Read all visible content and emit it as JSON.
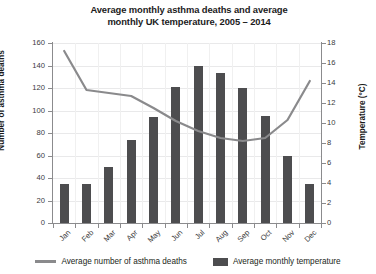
{
  "chart_data": {
    "type": "bar",
    "title": "Average monthly asthma deaths and average monthly UK temperature, 2005 – 2014",
    "title_line1": "Average monthly asthma deaths and average",
    "title_line2": "monthly UK temperature, 2005 – 2014",
    "categories": [
      "Jan",
      "Feb",
      "Mar",
      "Apr",
      "May",
      "Jun",
      "Jul",
      "Aug",
      "Sep",
      "Oct",
      "Nov",
      "Dec"
    ],
    "xlabel": "",
    "grid": true,
    "legend_position": "bottom",
    "series": [
      {
        "name": "Average number of asthma deaths",
        "type": "line",
        "axis": "right",
        "color": "#8a8a8c",
        "values": [
          17.2,
          13.3,
          13.0,
          12.7,
          11.5,
          10.2,
          9.2,
          8.5,
          8.2,
          8.5,
          10.3,
          14.2
        ]
      },
      {
        "name": "Average monthly temperature",
        "type": "bar",
        "axis": "left",
        "color": "#4d4d4f",
        "values": [
          35,
          35,
          50,
          74,
          94,
          121,
          140,
          133,
          120,
          95,
          60,
          35
        ]
      }
    ],
    "left_axis": {
      "label": "Number of asthma deaths",
      "ylim": [
        0,
        160
      ],
      "ticks": [
        0,
        20,
        40,
        60,
        80,
        100,
        120,
        140,
        160
      ]
    },
    "right_axis": {
      "label": "Temperature (°C)",
      "ylim": [
        0,
        18
      ],
      "ticks": [
        0,
        2,
        4,
        6,
        8,
        10,
        12,
        14,
        16,
        18
      ]
    }
  },
  "legend": {
    "items": [
      {
        "label": "Average number of asthma deaths",
        "marker": "line-marker"
      },
      {
        "label": "Average monthly temperature",
        "marker": "square-swatch"
      }
    ]
  }
}
